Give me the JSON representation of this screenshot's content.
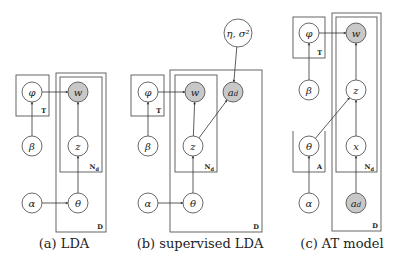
{
  "colors": {
    "observed_fill": "#c8c8c8",
    "latent_fill": "#ffffff",
    "stroke": "#444444"
  },
  "panels": [
    {
      "id": "lda",
      "caption": "(a) LDA",
      "caption_x": 64,
      "nodes": [
        {
          "id": "phi",
          "label": "φ",
          "x": 32,
          "y": 92,
          "r": 10,
          "observed": false
        },
        {
          "id": "w",
          "label": "w",
          "x": 78,
          "y": 92,
          "r": 10,
          "observed": true
        },
        {
          "id": "beta",
          "label": "β",
          "x": 32,
          "y": 146,
          "r": 10,
          "observed": false
        },
        {
          "id": "z",
          "label": "z",
          "x": 78,
          "y": 146,
          "r": 10,
          "observed": false
        },
        {
          "id": "alpha",
          "label": "α",
          "x": 32,
          "y": 203,
          "r": 10,
          "observed": false
        },
        {
          "id": "theta",
          "label": "θ",
          "x": 78,
          "y": 203,
          "r": 10,
          "observed": false
        }
      ],
      "edges": [
        [
          "phi",
          "w"
        ],
        [
          "beta",
          "phi"
        ],
        [
          "z",
          "w"
        ],
        [
          "theta",
          "z"
        ],
        [
          "alpha",
          "theta"
        ]
      ],
      "plates": [
        {
          "label": "T",
          "x": 16,
          "y": 75,
          "w": 33,
          "h": 41,
          "open_top": false
        },
        {
          "label": "D",
          "x": 56,
          "y": 73,
          "w": 50,
          "h": 159,
          "open_top": false
        },
        {
          "label": "Nd",
          "x": 60,
          "y": 77,
          "w": 42,
          "h": 95,
          "open_top": false
        }
      ]
    },
    {
      "id": "slda",
      "caption": "(b) supervised LDA",
      "caption_x": 200,
      "nodes": [
        {
          "id": "eta",
          "label": "η, σ²",
          "x": 238,
          "y": 33,
          "r": 14,
          "observed": false
        },
        {
          "id": "phi",
          "label": "φ",
          "x": 148,
          "y": 92,
          "r": 10,
          "observed": false
        },
        {
          "id": "w",
          "label": "w",
          "x": 195,
          "y": 92,
          "r": 10,
          "observed": true
        },
        {
          "id": "ad",
          "label": "a_d",
          "x": 233,
          "y": 92,
          "r": 10,
          "observed": true
        },
        {
          "id": "beta",
          "label": "β",
          "x": 148,
          "y": 146,
          "r": 10,
          "observed": false
        },
        {
          "id": "z",
          "label": "z",
          "x": 193,
          "y": 146,
          "r": 10,
          "observed": false
        },
        {
          "id": "alpha",
          "label": "α",
          "x": 148,
          "y": 203,
          "r": 10,
          "observed": false
        },
        {
          "id": "theta",
          "label": "θ",
          "x": 193,
          "y": 203,
          "r": 10,
          "observed": false
        }
      ],
      "edges": [
        [
          "phi",
          "w"
        ],
        [
          "beta",
          "phi"
        ],
        [
          "z",
          "w"
        ],
        [
          "theta",
          "z"
        ],
        [
          "alpha",
          "theta"
        ],
        [
          "eta",
          "ad"
        ],
        [
          "z",
          "ad"
        ]
      ],
      "plates": [
        {
          "label": "T",
          "x": 131,
          "y": 75,
          "w": 33,
          "h": 41,
          "open_top": false
        },
        {
          "label": "D",
          "x": 170,
          "y": 70,
          "w": 92,
          "h": 162,
          "open_top": false
        },
        {
          "label": "Nd",
          "x": 175,
          "y": 75,
          "w": 42,
          "h": 97,
          "open_top": false
        }
      ]
    },
    {
      "id": "at",
      "caption": "(c) AT model",
      "caption_x": 342,
      "nodes": [
        {
          "id": "phi",
          "label": "φ",
          "x": 309,
          "y": 33,
          "r": 10,
          "observed": false
        },
        {
          "id": "w",
          "label": "w",
          "x": 356,
          "y": 33,
          "r": 10,
          "observed": true
        },
        {
          "id": "beta",
          "label": "β",
          "x": 309,
          "y": 90,
          "r": 10,
          "observed": false
        },
        {
          "id": "z",
          "label": "z",
          "x": 356,
          "y": 90,
          "r": 10,
          "observed": false
        },
        {
          "id": "theta",
          "label": "θ",
          "x": 309,
          "y": 146,
          "r": 10,
          "observed": false
        },
        {
          "id": "x",
          "label": "x",
          "x": 356,
          "y": 146,
          "r": 10,
          "observed": false
        },
        {
          "id": "alpha",
          "label": "α",
          "x": 309,
          "y": 203,
          "r": 10,
          "observed": false
        },
        {
          "id": "ad",
          "label": "a_d",
          "x": 356,
          "y": 203,
          "r": 10,
          "observed": true
        }
      ],
      "edges": [
        [
          "phi",
          "w"
        ],
        [
          "beta",
          "phi"
        ],
        [
          "z",
          "w"
        ],
        [
          "x",
          "z"
        ],
        [
          "ad",
          "x"
        ],
        [
          "theta",
          "z"
        ],
        [
          "alpha",
          "theta"
        ]
      ],
      "plates": [
        {
          "label": "T",
          "x": 293,
          "y": 17,
          "w": 32,
          "h": 41,
          "open_top": false
        },
        {
          "label": "A",
          "x": 293,
          "y": 131,
          "w": 32,
          "h": 41,
          "open_top": true
        },
        {
          "label": "D",
          "x": 332,
          "y": 13,
          "w": 49,
          "h": 218,
          "open_top": false
        },
        {
          "label": "Nd",
          "x": 336,
          "y": 17,
          "w": 41,
          "h": 155,
          "open_top": false
        }
      ]
    }
  ]
}
